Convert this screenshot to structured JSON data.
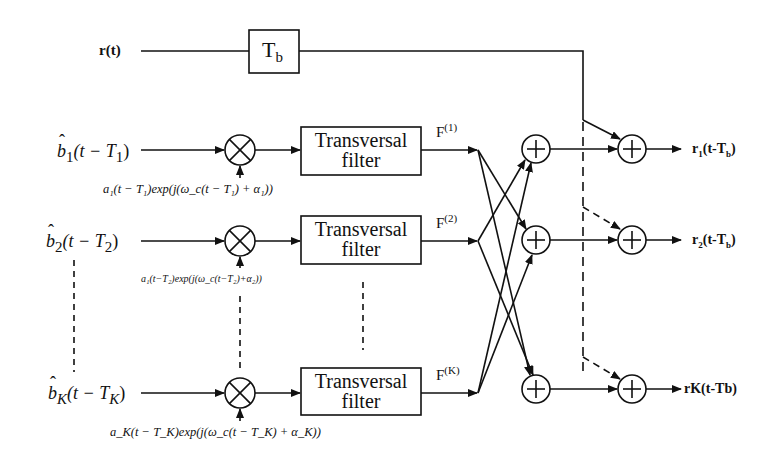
{
  "diagram": {
    "type": "multiuser interference cancellation block diagram",
    "input_signal": {
      "label": "r(t)",
      "delay_block": {
        "label": "T",
        "subscript": "b"
      }
    },
    "branches": [
      {
        "id": 1,
        "input_label": {
          "hat": "b",
          "sub": "1",
          "rest": "(t − T",
          "rest_sub": "1",
          "close": ")"
        },
        "modulation_label": "a₁(t − T₁)exp(j(ω_c(t − T₁) + α₁))",
        "filter": {
          "line1": "Transversal",
          "line2": "filter"
        },
        "output_label": {
          "base": "F",
          "sup": "(1)"
        }
      },
      {
        "id": 2,
        "input_label": {
          "hat": "b",
          "sub": "2",
          "rest": "(t − T",
          "rest_sub": "2",
          "close": ")"
        },
        "modulation_label": "a₁(t−T₂)exp(j(ω_c(t−T₂)+α₂))",
        "filter": {
          "line1": "Transversal",
          "line2": "filter"
        },
        "output_label": {
          "base": "F",
          "sup": "(2)"
        }
      },
      {
        "id": "K",
        "input_label": {
          "hat": "b",
          "sub": "K",
          "rest": "(t − T",
          "rest_sub": "K",
          "close": ")"
        },
        "modulation_label": "a_K(t − T_K)exp(j(ω_c(t − T_K) + α_K))",
        "filter": {
          "line1": "Transversal",
          "line2": "filter"
        },
        "output_label": {
          "base": "F",
          "sup": "(K)"
        }
      }
    ],
    "outputs": [
      {
        "base": "r",
        "sub": "1",
        "rest": "(t-T",
        "rest_sub": "b",
        "close": ")"
      },
      {
        "base": "r",
        "sub": "2",
        "rest": "(t-T",
        "rest_sub": "b",
        "close": ")"
      },
      {
        "text": "rK(t-Tb)"
      }
    ],
    "symbols": {
      "multiplier": "⊗",
      "adder": "⊕"
    },
    "colors": {
      "line": "#111111",
      "background": "#ffffff"
    }
  }
}
